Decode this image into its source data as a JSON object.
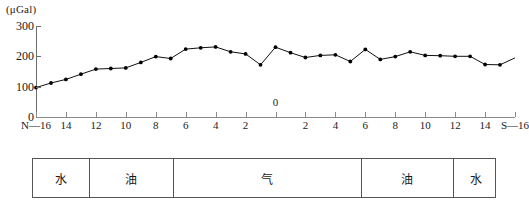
{
  "chart_data": {
    "type": "line",
    "title": "",
    "subtitle": "",
    "ylabel": "(μGal)",
    "xlabel": "",
    "ylim": [
      0,
      300
    ],
    "yticks": [
      0,
      100,
      200,
      300
    ],
    "ytick_labels": [
      "0",
      "100",
      "200",
      "300"
    ],
    "grid": false,
    "legend": null,
    "axis_origin_label": "0",
    "x_left_end_label": "N—16",
    "x_right_end_label": "S—16",
    "xtick_labels": [
      "N—16",
      "14",
      "12",
      "10",
      "8",
      "6",
      "4",
      "2",
      "2",
      "4",
      "6",
      "8",
      "10",
      "12",
      "14",
      "S—16"
    ],
    "x": [
      -16,
      -15,
      -14,
      -13,
      -12,
      -11,
      -10,
      -9,
      -8,
      -7,
      -6,
      -5,
      -4,
      -3,
      -2,
      -1,
      0,
      1,
      2,
      3,
      4,
      5,
      6,
      7,
      8,
      9,
      10,
      11,
      12,
      13,
      14,
      15,
      16
    ],
    "values": [
      97,
      112,
      124,
      141,
      158,
      160,
      162,
      180,
      199,
      193,
      224,
      228,
      231,
      215,
      208,
      172,
      230,
      212,
      196,
      203,
      205,
      183,
      223,
      190,
      199,
      215,
      203,
      202,
      200,
      200,
      173,
      172,
      195
    ],
    "series": [
      {
        "name": "gravity-anomaly",
        "values": [
          97,
          112,
          124,
          141,
          158,
          160,
          162,
          180,
          199,
          193,
          224,
          228,
          231,
          215,
          208,
          172,
          230,
          212,
          196,
          203,
          205,
          183,
          223,
          190,
          199,
          215,
          203,
          202,
          200,
          200,
          173,
          172,
          195
        ]
      }
    ],
    "marker": "filled-circle",
    "line_color": "#000000",
    "marker_color": "#000000"
  },
  "strata": {
    "cells": [
      {
        "label": "水",
        "width_pct": 12.2
      },
      {
        "label": "油",
        "width_pct": 17.8
      },
      {
        "label": "气",
        "width_pct": 40.5
      },
      {
        "label": "油",
        "width_pct": 19.7
      },
      {
        "label": "水",
        "width_pct": 9.8
      }
    ]
  }
}
